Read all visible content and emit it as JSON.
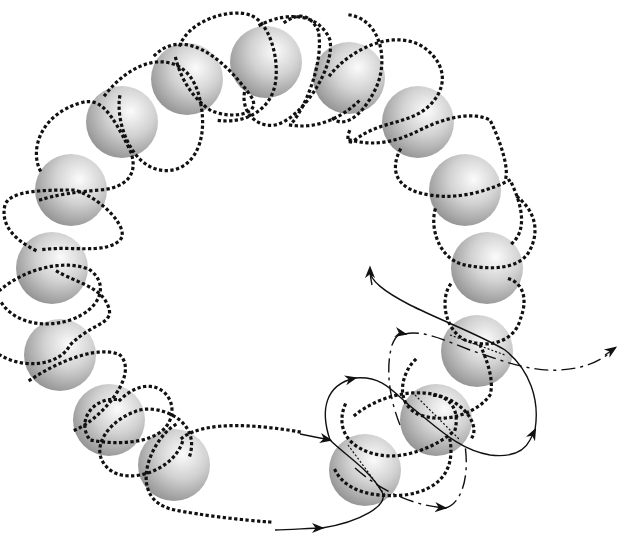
{
  "figure": {
    "title": "",
    "sphere_count": 15,
    "colors": {
      "background": "#ffffff",
      "sphere_light": "#f7f7f7",
      "sphere_mid": "#bdbdbd",
      "sphere_dark": "#8c8c8c",
      "line": "#111111"
    },
    "line_styles": [
      "dotted",
      "solid",
      "dash-dot"
    ],
    "arrows": [
      {
        "style": "solid",
        "direction": "right",
        "label": "incoming-lower"
      },
      {
        "style": "dotted-to-solid",
        "direction": "right",
        "label": "incoming-upper"
      },
      {
        "style": "solid",
        "direction": "up",
        "label": "loop-up"
      },
      {
        "style": "solid",
        "direction": "up-left",
        "label": "exit-upper-left"
      },
      {
        "style": "dash-dot",
        "direction": "up",
        "label": "dashdot-loop"
      },
      {
        "style": "dash-dot",
        "direction": "right",
        "label": "dashdot-lower"
      },
      {
        "style": "dash-dot",
        "direction": "up-right",
        "label": "exit-right"
      },
      {
        "style": "solid",
        "direction": "up-right",
        "label": "loop-right"
      }
    ]
  }
}
